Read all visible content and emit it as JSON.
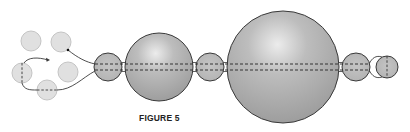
{
  "figure": {
    "caption": "FIGURE 5",
    "caption_pos": {
      "x": 139,
      "y": 113
    },
    "colors": {
      "background": "#ffffff",
      "small_fill": "#e0e0e0",
      "small_stroke": "#c4c4c4",
      "bead_fill_light": "#d6d6d6",
      "bead_fill_mid": "#b4b4b4",
      "bead_fill_dark": "#999999",
      "stroke": "#3a3a3a",
      "dash": "#333333"
    },
    "axis": {
      "y_top": 64,
      "y_bottom": 70,
      "x_start": 95,
      "x_end": 370
    },
    "loose_beads": [
      {
        "id": "top-left",
        "cx": 31,
        "cy": 41,
        "r": 10
      },
      {
        "id": "top-right",
        "cx": 61,
        "cy": 42,
        "r": 10
      },
      {
        "id": "middle-left",
        "cx": 22,
        "cy": 73,
        "r": 10,
        "dash": "vertical"
      },
      {
        "id": "middle-right",
        "cx": 68,
        "cy": 72,
        "r": 10
      },
      {
        "id": "bottom",
        "cx": 47,
        "cy": 90,
        "r": 10,
        "dash": "horizontal"
      }
    ],
    "chain_beads": [
      {
        "id": "bead-1",
        "cx": 108,
        "cy": 67,
        "r": 14
      },
      {
        "id": "bead-2",
        "cx": 159,
        "cy": 67,
        "r": 34
      },
      {
        "id": "bead-3",
        "cx": 210,
        "cy": 67,
        "r": 14
      },
      {
        "id": "bead-4",
        "cx": 283,
        "cy": 67,
        "r": 56
      },
      {
        "id": "bead-5",
        "cx": 356,
        "cy": 67,
        "r": 14
      }
    ],
    "end_bead": {
      "id": "end-bead",
      "cx": 387,
      "cy": 67,
      "r": 11,
      "dash": "vertical"
    },
    "connectors": [
      {
        "id": "top-strand",
        "d": "M68 50 C 78 58, 86 62, 95 64"
      },
      {
        "id": "bottom-strand",
        "d": "M57 90 C 72 90, 82 78, 95 71"
      },
      {
        "id": "loop-strand",
        "d": "M22 83 C 24 90, 30 90, 37 90"
      },
      {
        "id": "arrow-strand",
        "d": "M24 63 C 28 57, 38 57, 48 60"
      },
      {
        "id": "end-loop-top",
        "d": "M369 64 C 372 58, 376 55, 382 57"
      },
      {
        "id": "end-loop-bottom",
        "d": "M369 70 C 372 76, 376 79, 382 77"
      }
    ],
    "arrow_tip": {
      "x": 50,
      "y": 60
    },
    "strand_start_dot": {
      "x": 68,
      "y": 50
    }
  }
}
